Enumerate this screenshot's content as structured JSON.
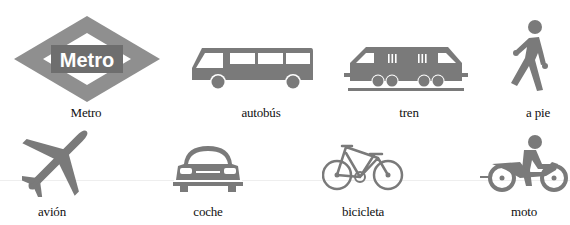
{
  "colors": {
    "icon_gray": "#7a7a7a",
    "metro_diamond": "#8f8f8f",
    "metro_box": "#6e6e6e",
    "metro_text": "#ffffff",
    "label_text": "#111111"
  },
  "items": [
    {
      "id": "metro",
      "label": "Metro",
      "icon": "metro-logo-icon",
      "logo_text": "Metro"
    },
    {
      "id": "autobus",
      "label": "autobús",
      "icon": "bus-icon"
    },
    {
      "id": "tren",
      "label": "tren",
      "icon": "train-icon"
    },
    {
      "id": "a_pie",
      "label": "a pie",
      "icon": "walking-person-icon"
    },
    {
      "id": "avion",
      "label": "avión",
      "icon": "airplane-icon"
    },
    {
      "id": "coche",
      "label": "coche",
      "icon": "car-icon"
    },
    {
      "id": "bicicleta",
      "label": "bicicleta",
      "icon": "bicycle-icon"
    },
    {
      "id": "moto",
      "label": "moto",
      "icon": "motorcycle-icon"
    }
  ]
}
